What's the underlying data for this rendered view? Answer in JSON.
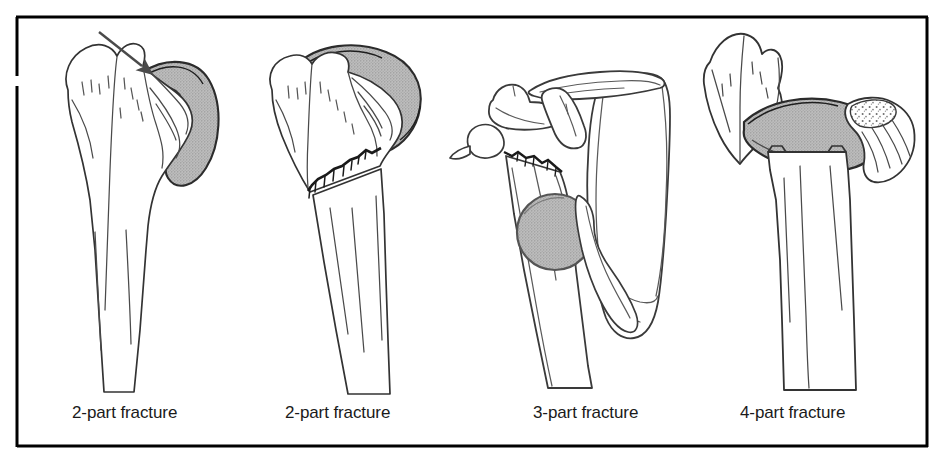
{
  "figure": {
    "name": "proximal-humerus-fracture-classification-plate",
    "kind": "line-art medical illustration",
    "background_color": "#ffffff",
    "frame": {
      "border_color": "#000000",
      "border_width_px": 3,
      "left": 16,
      "top": 16,
      "right": 928,
      "bottom": 448,
      "left_edge_gap": {
        "from_y": 76,
        "to_y": 86
      }
    },
    "ink_color": "#3a3a3a",
    "outline_color": "#2b2b2b",
    "shade_fill_color": "#b4b4b4",
    "shade_stipple_color": "#8f8f8f",
    "arrow_color": "#4a4a4a"
  },
  "panels": [
    {
      "id": "panel-1",
      "caption": "2-part fracture",
      "caption_x": 72,
      "caption_y": 418,
      "description": "Proximal humerus, anterior view, with arrow indicating displaced greater tuberosity fragment; shaded glenoid/scapular crescent lateral to head.",
      "has_arrow": true,
      "parts_count": 2,
      "elements": [
        "humeral-shaft",
        "humeral-head",
        "greater-tuberosity",
        "lesser-tuberosity",
        "glenoid-crescent",
        "indicator-arrow"
      ]
    },
    {
      "id": "panel-2",
      "caption": "2-part fracture",
      "caption_x": 285,
      "caption_y": 418,
      "description": "Proximal humerus with jagged transverse fracture line across the surgical neck; shaded glenoid crescent capping the head.",
      "has_arrow": false,
      "parts_count": 2,
      "elements": [
        "humeral-shaft",
        "humeral-head",
        "greater-tuberosity",
        "glenoid-crescent",
        "fracture-line-surgical-neck"
      ]
    },
    {
      "id": "panel-3",
      "caption": "3-part fracture",
      "caption_x": 533,
      "caption_y": 418,
      "description": "Shoulder girdle with scapula, clavicle, acromion and coracoid; jagged fracture at humeral neck with displaced shaded round humeral head fragment.",
      "has_arrow": false,
      "parts_count": 3,
      "elements": [
        "scapula-body",
        "clavicle",
        "acromion",
        "coracoid-process",
        "humeral-shaft",
        "humeral-head-circle",
        "fracture-line-neck"
      ]
    },
    {
      "id": "panel-4",
      "caption": "4-part fracture",
      "caption_x": 740,
      "caption_y": 418,
      "description": "Four separated fragments: greater tuberosity at left, shaded articular head crescent centrally, lesser tuberosity with stippled cancellous fracture surface at right, and humeral shaft below.",
      "has_arrow": false,
      "parts_count": 4,
      "elements": [
        "greater-tuberosity-fragment",
        "articular-head-crescent",
        "lesser-tuberosity-fragment",
        "cancellous-stipple",
        "humeral-shaft"
      ]
    }
  ]
}
